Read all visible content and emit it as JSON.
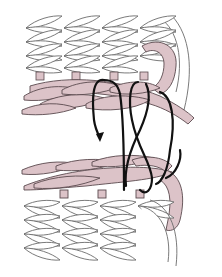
{
  "diagram": {
    "type": "knitting-seam-illustration",
    "colors": {
      "background": "#ffffff",
      "fabric_fill": "#ffffff",
      "fabric_outline": "#6b6b6b",
      "edge_yarn_fill": "#dcc3c8",
      "edge_yarn_outline": "#5a4a4e",
      "working_yarn": "#111111"
    },
    "elements": {
      "top_fabric": "White knitted stitches, 4 rows",
      "top_edge": "Pink braided chain edge",
      "bottom_edge": "Pink braided chain edge",
      "bottom_fabric": "White knitted stitches, 4 rows",
      "working_yarn": "Black yarn looping between edges",
      "arrow": "Downward arrowhead on working yarn"
    }
  }
}
